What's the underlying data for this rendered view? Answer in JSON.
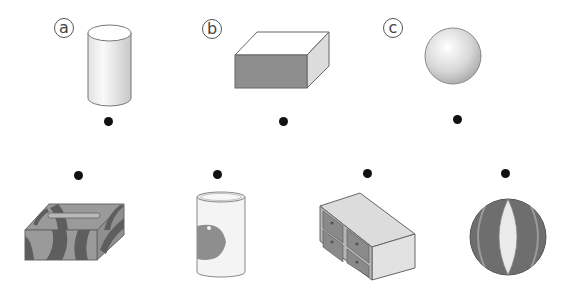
{
  "shapes": [
    {
      "label": "ⓐ",
      "letter": "a",
      "name": "cylinder"
    },
    {
      "label": "ⓑ",
      "letter": "b",
      "name": "rectangular prism"
    },
    {
      "label": "ⓒ",
      "letter": "c",
      "name": "sphere"
    }
  ],
  "objects": [
    {
      "name": "tissue box"
    },
    {
      "name": "can"
    },
    {
      "name": "drawer cabinet"
    },
    {
      "name": "beach ball"
    }
  ],
  "colors": {
    "dot": "#111111",
    "outline": "#666666",
    "dark_gray": "#707070",
    "mid_gray": "#8c8c8c",
    "light_gray": "#bdbdbd"
  }
}
